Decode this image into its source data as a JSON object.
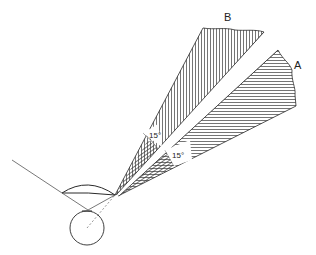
{
  "diagram": {
    "type": "optics-visual-field-wedges",
    "labels": {
      "wedge_a": "A",
      "wedge_b": "B",
      "angle_a": "15°",
      "angle_b": "15°"
    },
    "colors": {
      "line": "#2a2a2a",
      "hatch": "#3a3a3a",
      "background": "#ffffff"
    },
    "geometry": {
      "apex": [
        115,
        195
      ],
      "wedge_b": {
        "left_edge_end": [
          203,
          28
        ],
        "right_edge_end": [
          264,
          32
        ],
        "hatch": "vertical"
      },
      "wedge_a": {
        "left_edge_end": [
          278,
          50
        ],
        "right_edge_end": [
          295,
          106
        ],
        "hatch": "horizontal"
      },
      "eye_circle": {
        "center": [
          87,
          228
        ],
        "radius": 17
      },
      "lens": {
        "left": [
          62,
          193
        ],
        "right": [
          115,
          195
        ]
      },
      "incident_line": {
        "from": [
          12,
          160
        ],
        "to": [
          62,
          193
        ]
      }
    }
  }
}
